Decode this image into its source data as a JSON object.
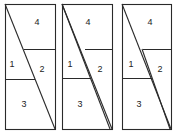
{
  "diagram": {
    "stroke_color": "#2a2a2a",
    "panels": [
      {
        "name": "panel-left",
        "box": {
          "x": 5,
          "y": 4,
          "w": 50,
          "h": 125
        },
        "hlines": [
          {
            "x1": 24,
            "x2": 55,
            "y": 49
          },
          {
            "x1": 5,
            "x2": 35,
            "y": 79
          }
        ],
        "diagonals": [
          {
            "x1": 5,
            "y1": 4,
            "x2": 55,
            "y2": 129
          }
        ],
        "labels": [
          {
            "text": "4",
            "x": 37,
            "y": 25
          },
          {
            "text": "1",
            "x": 12,
            "y": 67
          },
          {
            "text": "2",
            "x": 42,
            "y": 72
          },
          {
            "text": "3",
            "x": 24,
            "y": 107
          }
        ]
      },
      {
        "name": "panel-middle",
        "box": {
          "x": 62,
          "y": 4,
          "w": 50,
          "h": 125
        },
        "hlines": [
          {
            "x1": 85,
            "x2": 112,
            "y": 49
          },
          {
            "x1": 62,
            "x2": 91,
            "y": 78
          }
        ],
        "diagonals": [
          {
            "x1": 62,
            "y1": 4,
            "x2": 112,
            "y2": 129
          },
          {
            "x1": 62,
            "y1": 4,
            "x2": 110,
            "y2": 129
          }
        ],
        "labels": [
          {
            "text": "4",
            "x": 88,
            "y": 25
          },
          {
            "text": "1",
            "x": 70,
            "y": 67
          },
          {
            "text": "2",
            "x": 100,
            "y": 72
          },
          {
            "text": "3",
            "x": 80,
            "y": 107
          }
        ]
      },
      {
        "name": "panel-right",
        "box": {
          "x": 122,
          "y": 4,
          "w": 49,
          "h": 125
        },
        "hlines": [
          {
            "x1": 143,
            "x2": 171,
            "y": 49
          },
          {
            "x1": 122,
            "x2": 152,
            "y": 78
          }
        ],
        "diagonals": [
          {
            "x1": 122,
            "y1": 4,
            "x2": 171,
            "y2": 129
          },
          {
            "x1": 142,
            "y1": 49,
            "x2": 170,
            "y2": 129
          }
        ],
        "labels": [
          {
            "text": "4",
            "x": 150,
            "y": 25
          },
          {
            "text": "1",
            "x": 131,
            "y": 67
          },
          {
            "text": "2",
            "x": 160,
            "y": 72
          },
          {
            "text": "3",
            "x": 139,
            "y": 107
          }
        ]
      }
    ]
  }
}
